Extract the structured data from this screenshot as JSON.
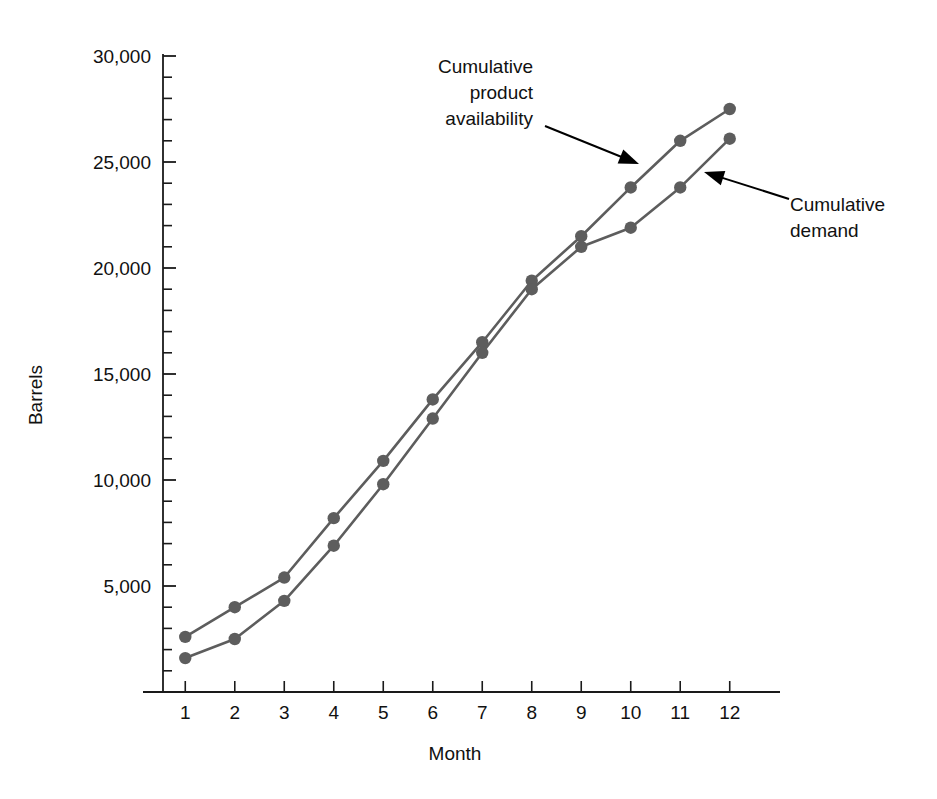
{
  "chart_data": {
    "type": "line",
    "title": "",
    "subtitle": "",
    "xlabel": "Month",
    "ylabel": "Barrels",
    "x": [
      1,
      2,
      3,
      4,
      5,
      6,
      7,
      8,
      9,
      10,
      11,
      12
    ],
    "categories": [
      "1",
      "2",
      "3",
      "4",
      "5",
      "6",
      "7",
      "8",
      "9",
      "10",
      "11",
      "12"
    ],
    "xlim": [
      0.55,
      12.45
    ],
    "ylim": [
      0,
      30000
    ],
    "grid": false,
    "legend_position": "annotations-inline",
    "y_major_ticks": [
      0,
      5000,
      10000,
      15000,
      20000,
      25000,
      30000
    ],
    "y_major_tick_labels": [
      "",
      "5,000",
      "10,000",
      "15,000",
      "20,000",
      "25,000",
      "30,000"
    ],
    "y_minor_tick_step": 1000,
    "x_tick_labels": [
      "1",
      "2",
      "3",
      "4",
      "5",
      "6",
      "7",
      "8",
      "9",
      "10",
      "11",
      "12"
    ],
    "series": [
      {
        "name": "Cumulative product availability",
        "color": "#5d5d5d",
        "values": [
          2600,
          4000,
          5400,
          8200,
          10900,
          13800,
          16500,
          19400,
          21500,
          23800,
          26000,
          27500
        ]
      },
      {
        "name": "Cumulative demand",
        "color": "#5d5d5d",
        "values": [
          1600,
          2500,
          4300,
          6900,
          9800,
          12900,
          16000,
          19000,
          21000,
          21900,
          23800,
          26100
        ]
      }
    ],
    "annotations": [
      {
        "id": "availability-annotation",
        "lines": [
          "Cumulative",
          "product",
          "availability"
        ],
        "text": "Cumulative product availability",
        "align": "right",
        "points_to_series": "Cumulative product availability",
        "points_to_x": 10.4
      },
      {
        "id": "demand-annotation",
        "lines": [
          "Cumulative",
          "demand"
        ],
        "text": "Cumulative demand",
        "align": "left",
        "points_to_series": "Cumulative demand",
        "points_to_x": 11.4
      }
    ]
  },
  "colors": {
    "series": "#5d5d5d",
    "axis": "#1a1a1a",
    "text": "#111111",
    "background": "#ffffff",
    "annotation_arrow": "#000000"
  }
}
